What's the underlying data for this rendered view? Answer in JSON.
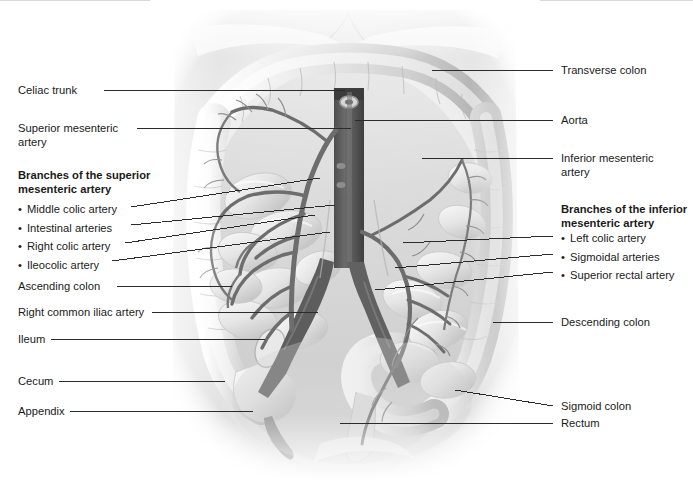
{
  "figure": {
    "style": "grayscale-anatomical-illustration",
    "colors": {
      "background": "#ffffff",
      "leader_line": "#2b2b2b",
      "text": "#1a1a1a",
      "organ_light": "#f2f2f2",
      "organ_mid": "#c9c9c9",
      "organ_shadow": "#9a9a9a",
      "vessel": "#6b6b6b",
      "vessel_dark": "#4a4a4a",
      "aorta": "#575757",
      "top_rule": "#d9d9d9"
    }
  },
  "labels_left": [
    {
      "id": "celiac-trunk",
      "text": "Celiac trunk",
      "x": 18,
      "y": 84,
      "line_from_x": 104,
      "line_from_y": 90,
      "line_to_x": 345,
      "line_to_y": 90
    },
    {
      "id": "superior-mesenteric-artery",
      "text": "Superior mesenteric\nartery",
      "x": 18,
      "y": 122,
      "line_from_x": 137,
      "line_from_y": 128,
      "line_to_x": 351,
      "line_to_y": 128
    }
  ],
  "group_left": {
    "heading": "Branches of the superior\nmesenteric artery",
    "heading_x": 18,
    "heading_y": 169,
    "items": [
      {
        "label": "Middle colic artery",
        "line_to_x": 320,
        "line_to_y": 178
      },
      {
        "label": "Intestinal arteries",
        "line_to_x": 335,
        "line_to_y": 205
      },
      {
        "label": "Right colic artery",
        "line_to_x": 315,
        "line_to_y": 215
      },
      {
        "label": "Ileocolic artery",
        "line_to_x": 330,
        "line_to_y": 232
      }
    ]
  },
  "labels_left_lower": [
    {
      "id": "ascending-colon",
      "text": "Ascending colon",
      "x": 18,
      "y": 280,
      "line_from_x": 117,
      "line_from_y": 286,
      "line_to_x": 232,
      "line_to_y": 286
    },
    {
      "id": "right-common-iliac-artery",
      "text": "Right common iliac artery",
      "x": 18,
      "y": 306,
      "line_from_x": 152,
      "line_from_y": 312,
      "line_to_x": 318,
      "line_to_y": 312
    },
    {
      "id": "ileum",
      "text": "Ileum",
      "x": 18,
      "y": 333,
      "line_from_x": 51,
      "line_from_y": 339,
      "line_to_x": 265,
      "line_to_y": 339
    },
    {
      "id": "cecum",
      "text": "Cecum",
      "x": 18,
      "y": 375,
      "line_from_x": 59,
      "line_from_y": 381,
      "line_to_x": 225,
      "line_to_y": 381
    },
    {
      "id": "appendix",
      "text": "Appendix",
      "x": 18,
      "y": 405,
      "line_from_x": 70,
      "line_from_y": 411,
      "line_to_x": 253,
      "line_to_y": 411
    }
  ],
  "labels_right": [
    {
      "id": "transverse-colon",
      "text": "Transverse colon",
      "x": 561,
      "y": 64,
      "line_from_x": 553,
      "line_from_y": 70,
      "line_to_x": 432,
      "line_to_y": 70
    },
    {
      "id": "aorta",
      "text": "Aorta",
      "x": 561,
      "y": 114,
      "line_from_x": 553,
      "line_from_y": 120,
      "line_to_x": 355,
      "line_to_y": 120
    },
    {
      "id": "inferior-mesenteric-artery",
      "text": "Inferior mesenteric\nartery",
      "x": 561,
      "y": 152,
      "line_from_x": 553,
      "line_from_y": 158,
      "line_to_x": 422,
      "line_to_y": 158
    }
  ],
  "group_right": {
    "heading": "Branches of the inferior\nmesenteric artery",
    "heading_x": 561,
    "heading_y": 203,
    "items": [
      {
        "label": "Left colic artery",
        "line_to_x": 403,
        "line_to_y": 243
      },
      {
        "label": "Sigmoidal arteries",
        "line_to_x": 395,
        "line_to_y": 268
      },
      {
        "label": "Superior rectal artery",
        "line_to_x": 375,
        "line_to_y": 290
      }
    ]
  },
  "labels_right_lower": [
    {
      "id": "descending-colon",
      "text": "Descending colon",
      "x": 561,
      "y": 316,
      "line_from_x": 553,
      "line_from_y": 322,
      "line_to_x": 493,
      "line_to_y": 322
    },
    {
      "id": "sigmoid-colon",
      "text": "Sigmoid colon",
      "x": 561,
      "y": 400,
      "line_from_x": 553,
      "line_from_y": 406,
      "line_to_x": 455,
      "line_to_y": 390
    },
    {
      "id": "rectum",
      "text": "Rectum",
      "x": 561,
      "y": 417,
      "line_from_x": 553,
      "line_from_y": 423,
      "line_to_x": 340,
      "line_to_y": 423
    }
  ]
}
